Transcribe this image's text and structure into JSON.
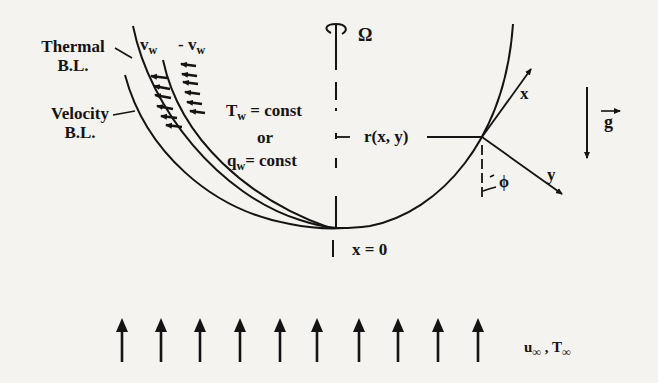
{
  "figure": {
    "labels": {
      "thermal_bl": [
        "Thermal",
        "B.L."
      ],
      "velocity_bl": [
        "Velocity",
        "B.L."
      ],
      "v_w": {
        "main": "v",
        "sub": "w"
      },
      "neg_v_w": {
        "main": "- v",
        "sub": "w"
      },
      "omega": "Ω",
      "wall_condition_1": {
        "main": "T",
        "sub": "w",
        "rest": " = const"
      },
      "or": "or",
      "wall_condition_2": {
        "main": "q",
        "sub": "w",
        "rest": "= const"
      },
      "radius": "r(x, y)",
      "x_axis": "x",
      "y_axis": "y",
      "angle": "ϕ",
      "gravity": "g",
      "origin": "x = 0",
      "freestream": {
        "u": "u",
        "u_sub": "∞",
        "sep": " , ",
        "t": "T",
        "t_sub": "∞"
      }
    },
    "icons": {
      "rotation": "rotation-arrow-icon",
      "gravity_vector": "vector-arrow-icon",
      "freestream_arrows": 10
    },
    "colors": {
      "ink": "#141414",
      "paper": "#f4f3ef"
    }
  }
}
